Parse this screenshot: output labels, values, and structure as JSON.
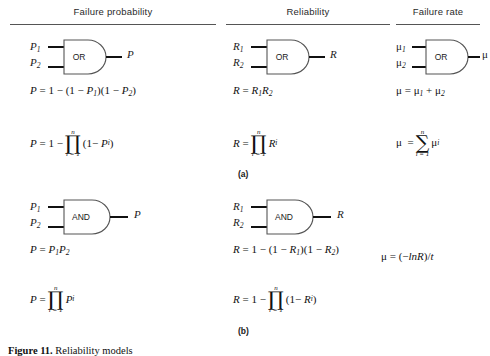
{
  "headers": [
    {
      "label": "Failure probability"
    },
    {
      "label": "Reliability"
    },
    {
      "label": "Failure rate"
    }
  ],
  "sections": [
    {
      "id": "a",
      "part_label": "(a)",
      "gate_type": "OR",
      "columns": [
        {
          "name": "failure-probability",
          "gate": {
            "label": "OR",
            "inputs": [
              "P",
              "P"
            ],
            "input_subs": [
              "1",
              "2"
            ],
            "output": "P",
            "output_sub": ""
          },
          "formula_1": "P = 1 − (1 − P₁)(1 − P₂)",
          "formula_2": "P = 1 − ∏ (1 − Pᵢ),  i = 1..n"
        },
        {
          "name": "reliability",
          "gate": {
            "label": "OR",
            "inputs": [
              "R",
              "R"
            ],
            "input_subs": [
              "1",
              "2"
            ],
            "output": "R",
            "output_sub": ""
          },
          "formula_1": "R = R₁R₂",
          "formula_2": "R = ∏ Rᵢ,  i = 1..n"
        },
        {
          "name": "failure-rate",
          "gate": {
            "label": "OR",
            "inputs": [
              "μ",
              "μ"
            ],
            "input_subs": [
              "1",
              "2"
            ],
            "output": "μ",
            "output_sub": ""
          },
          "formula_1": "μ = μ₁ + μ₂",
          "formula_2": "μ = ∑ μᵢ,  i = 1..n"
        }
      ]
    },
    {
      "id": "b",
      "part_label": "(b)",
      "gate_type": "AND",
      "columns": [
        {
          "name": "failure-probability",
          "gate": {
            "label": "AND",
            "inputs": [
              "P",
              "P"
            ],
            "input_subs": [
              "1",
              "2"
            ],
            "output": "P",
            "output_sub": ""
          },
          "formula_1": "P = P₁P₂",
          "formula_2": "P = ∏ Pᵢ,  i = 1..n"
        },
        {
          "name": "reliability",
          "gate": {
            "label": "AND",
            "inputs": [
              "R",
              "R"
            ],
            "input_subs": [
              "1",
              "2"
            ],
            "output": "R",
            "output_sub": ""
          },
          "formula_1": "R = 1 − (1 − R₁)(1 − R₂)",
          "formula_2": "R = 1 − ∏ (1 − Rᵢ),  i = 1..n"
        },
        {
          "name": "failure-rate",
          "gate": null,
          "formula_1": "μ = (−lnR)/t",
          "formula_2": ""
        }
      ]
    }
  ],
  "symbols": {
    "P": "P",
    "R": "R",
    "mu": "μ",
    "n": "n",
    "i": "i",
    "one": "1",
    "t": "t",
    "ln": "ln",
    "sub1": "1",
    "sub2": "2",
    "subi": "i",
    "minus": "−",
    "plus": "+",
    "equals": "=",
    "prod": "∏",
    "sum": "∑",
    "ilim": "i = 1",
    "lparen": "(",
    "rparen": ")"
  },
  "caption": {
    "figure_word": "Figure",
    "number": "11",
    "text": "Reliability models"
  }
}
